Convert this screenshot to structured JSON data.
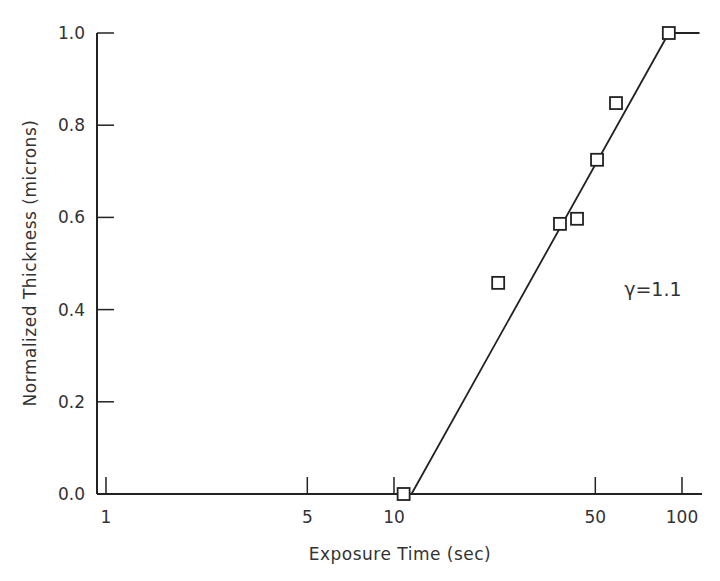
{
  "chart_data": {
    "type": "scatter",
    "title": "",
    "xlabel": "Exposure Time (sec)",
    "ylabel": "Normalized Thickness (microns)",
    "xscale": "log",
    "xlim": [
      0.93,
      125
    ],
    "ylim": [
      0.0,
      1.0
    ],
    "x_ticks": [
      1,
      5,
      10,
      50,
      100
    ],
    "x_tick_labels": [
      "1",
      "5",
      "10",
      "50",
      "100"
    ],
    "y_ticks": [
      0.0,
      0.2,
      0.4,
      0.6,
      0.8,
      1.0
    ],
    "y_tick_labels": [
      "0.0",
      "0.2",
      "0.4",
      "0.6",
      "0.8",
      "1.0"
    ],
    "grid": false,
    "legend": null,
    "series": [
      {
        "name": "measured",
        "marker": "open-square",
        "x": [
          10.8,
          23,
          37.7,
          43.2,
          50.7,
          59,
          90
        ],
        "y": [
          0.0,
          0.458,
          0.586,
          0.597,
          0.725,
          0.848,
          1.0
        ]
      },
      {
        "name": "fit",
        "style": "line",
        "x": [
          1,
          11.5,
          90,
          115
        ],
        "y": [
          0.0,
          0.0,
          1.0,
          1.0
        ]
      }
    ],
    "annotations": [
      {
        "text": "γ=1.1",
        "x": 63,
        "y": 0.46
      }
    ]
  }
}
